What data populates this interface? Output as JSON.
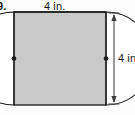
{
  "figure": {
    "problem_number": "9.",
    "shape": "square",
    "top_dimension_label": "4 in.",
    "right_dimension_label": "4 in.",
    "colors": {
      "shaded_region": "#c9c9c9",
      "unshaded_region": "#ffffff",
      "outline": "#1a1a1a",
      "dimension_line": "#555555",
      "background": "#fdfdfd"
    },
    "geometry": {
      "square_side_in": 4,
      "semicircle_radius_in": 2,
      "semicircle_count": 2,
      "semicircle_centers": [
        "left side midpoint",
        "right side midpoint"
      ],
      "square_px": {
        "x": 14,
        "y": 12,
        "width": 92,
        "height": 93
      },
      "dimension_line_x_px": 114,
      "midpoint_dot_left_px": {
        "x": 14,
        "y": 58
      },
      "midpoint_dot_right_px": {
        "x": 106,
        "y": 58
      }
    }
  }
}
